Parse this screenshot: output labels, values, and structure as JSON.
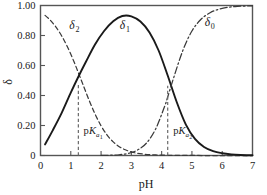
{
  "chart_data": {
    "type": "line",
    "title": "",
    "xlabel": "pH",
    "ylabel": "δ",
    "xlim": [
      0,
      7
    ],
    "ylim": [
      0,
      1.0
    ],
    "grid": false,
    "legend_position": "inline-curve-labels",
    "xticks": [
      0,
      1,
      2,
      3,
      4,
      5,
      6,
      7
    ],
    "xtick_labels": [
      "0",
      "1",
      "2",
      "3",
      "4",
      "5",
      "6",
      "7"
    ],
    "yticks": [
      0,
      0.2,
      0.4,
      0.6,
      0.8,
      1.0
    ],
    "ytick_labels": [
      "0",
      "0.20",
      "0.40",
      "0.60",
      "0.80",
      "1.00"
    ],
    "pKa1": 1.25,
    "pKa2": 4.2,
    "series": [
      {
        "name": "δ2",
        "label": "δ",
        "label_sub": "2",
        "style": "dashed",
        "color": "#3a3a3a",
        "label_x": 0.95,
        "label_y": 0.845,
        "x": [
          0.15,
          0.3,
          0.5,
          0.7,
          0.9,
          1.1,
          1.25,
          1.4,
          1.6,
          1.8,
          2.0,
          2.2,
          2.4,
          2.6,
          2.8,
          3.0,
          3.2,
          3.4,
          3.6,
          3.8,
          4.0,
          4.4,
          5.0,
          6.0,
          7.0
        ],
        "y": [
          0.934,
          0.907,
          0.859,
          0.797,
          0.72,
          0.628,
          0.552,
          0.474,
          0.371,
          0.277,
          0.198,
          0.136,
          0.091,
          0.059,
          0.038,
          0.024,
          0.015,
          0.0094,
          0.0058,
          0.0036,
          0.0022,
          0.0008,
          0.0001,
          0.0,
          0.0
        ]
      },
      {
        "name": "δ1",
        "label": "δ",
        "label_sub": "1",
        "style": "solid",
        "color": "#1a1a1a",
        "label_x": 2.62,
        "label_y": 0.845,
        "x": [
          0.15,
          0.4,
          0.7,
          1.0,
          1.25,
          1.5,
          1.8,
          2.1,
          2.4,
          2.7,
          3.0,
          3.3,
          3.6,
          3.9,
          4.2,
          4.5,
          4.8,
          5.1,
          5.4,
          5.7,
          6.0,
          6.3,
          6.6,
          7.0
        ],
        "y": [
          0.074,
          0.166,
          0.284,
          0.419,
          0.525,
          0.625,
          0.74,
          0.83,
          0.895,
          0.93,
          0.928,
          0.893,
          0.82,
          0.7,
          0.533,
          0.355,
          0.206,
          0.111,
          0.057,
          0.029,
          0.015,
          0.0075,
          0.0037,
          0.0015
        ]
      },
      {
        "name": "δ0",
        "label": "δ",
        "label_sub": "0",
        "style": "dashdot",
        "color": "#3a3a3a",
        "label_x": 5.42,
        "label_y": 0.865,
        "x": [
          2.0,
          2.3,
          2.6,
          2.9,
          3.2,
          3.5,
          3.8,
          4.1,
          4.2,
          4.4,
          4.7,
          5.0,
          5.3,
          5.6,
          5.9,
          6.2,
          6.5,
          7.0
        ],
        "y": [
          0.0006,
          0.0018,
          0.005,
          0.014,
          0.036,
          0.083,
          0.176,
          0.328,
          0.39,
          0.52,
          0.7,
          0.83,
          0.908,
          0.952,
          0.976,
          0.988,
          0.994,
          0.998
        ]
      }
    ],
    "annotations": [
      {
        "name": "pKa1-marker",
        "text": "pK",
        "sub": "a",
        "sub2": "1",
        "x": 1.25,
        "y_top": 0.47,
        "label_x": 1.42,
        "label_y": 0.145
      },
      {
        "name": "pKa2-marker",
        "text": "pK",
        "sub": "a",
        "sub2": "2",
        "x": 4.2,
        "y_top": 0.465,
        "label_x": 4.38,
        "label_y": 0.145
      }
    ]
  },
  "axes": {
    "x_title": "pH",
    "y_title": "δ"
  },
  "colors": {
    "axis": "#555555",
    "curve_primary": "#1a1a1a",
    "curve_secondary": "#3a3a3a",
    "background": "#ffffff"
  }
}
